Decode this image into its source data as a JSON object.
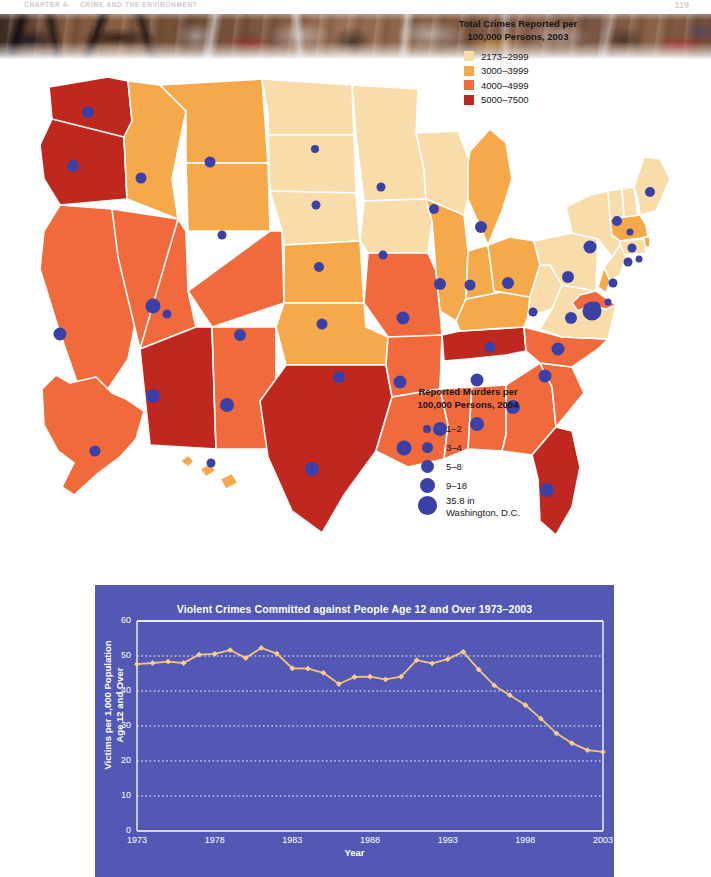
{
  "running_head": {
    "chapter": "CHAPTER 4",
    "separator": "•",
    "title": "CRIME AND THE ENVIRONMENT",
    "page_number": "119"
  },
  "photo": {
    "caption": "graffiti-covered-wall-photograph",
    "visible_tag_text": "R"
  },
  "crime_legend": {
    "title_line1": "Total Crimes Reported per",
    "title_line2": "100,000 Persons, 2003",
    "items": [
      {
        "label": "2173–2999",
        "color": "#f8dcaa"
      },
      {
        "label": "3000–3999",
        "color": "#f6a94a"
      },
      {
        "label": "4000–4999",
        "color": "#f06a3c"
      },
      {
        "label": "5000–7500",
        "color": "#c0281f"
      }
    ]
  },
  "murder_legend": {
    "title_line1": "Reported Murders per",
    "title_line2": "100,000 Persons, 2004",
    "dot_color": "#3b40a6",
    "items": [
      {
        "label": "1–2",
        "size": 8
      },
      {
        "label": "3–4",
        "size": 11
      },
      {
        "label": "5–8",
        "size": 13
      },
      {
        "label": "9–18",
        "size": 15
      },
      {
        "label": "35.8 in",
        "label2": "Washington, D.C.",
        "size": 19
      }
    ]
  },
  "map": {
    "name": "united-states-choropleth",
    "background": "#ffffff",
    "border_color": "#ffffff",
    "states": [
      {
        "code": "WA",
        "crime_color": "#c0281f",
        "dot": 12,
        "dx": 88,
        "dy": 53
      },
      {
        "code": "OR",
        "crime_color": "#c0281f",
        "dot": 12,
        "dx": 73,
        "dy": 107
      },
      {
        "code": "CA",
        "crime_color": "#f06a3c",
        "dot": 13,
        "dx": 60,
        "dy": 275
      },
      {
        "code": "NV",
        "crime_color": "#f06a3c",
        "dot": 15,
        "dx": 153,
        "dy": 247
      },
      {
        "code": "ID",
        "crime_color": "#f6a94a",
        "dot": 11,
        "dx": 141,
        "dy": 119
      },
      {
        "code": "MT",
        "crime_color": "#f6a94a",
        "dot": 11,
        "dx": 210,
        "dy": 103
      },
      {
        "code": "WY",
        "crime_color": "#f6a94a",
        "dot": 9,
        "dx": 222,
        "dy": 176
      },
      {
        "code": "UT",
        "crime_color": "#f06a3c",
        "dot": 9,
        "dx": 167,
        "dy": 255
      },
      {
        "code": "AZ",
        "crime_color": "#c0281f",
        "dot": 14,
        "dx": 153,
        "dy": 337
      },
      {
        "code": "NM",
        "crime_color": "#f06a3c",
        "dot": 14,
        "dx": 227,
        "dy": 346
      },
      {
        "code": "CO",
        "crime_color": "#f06a3c",
        "dot": 12,
        "dx": 240,
        "dy": 276
      },
      {
        "code": "ND",
        "crime_color": "#f8dcaa",
        "dot": 8,
        "dx": 315,
        "dy": 90
      },
      {
        "code": "SD",
        "crime_color": "#f8dcaa",
        "dot": 9,
        "dx": 316,
        "dy": 146
      },
      {
        "code": "NE",
        "crime_color": "#f8dcaa",
        "dot": 10,
        "dx": 319,
        "dy": 208
      },
      {
        "code": "KS",
        "crime_color": "#f6a94a",
        "dot": 11,
        "dx": 322,
        "dy": 265
      },
      {
        "code": "OK",
        "crime_color": "#f6a94a",
        "dot": 12,
        "dx": 339,
        "dy": 318
      },
      {
        "code": "TX",
        "crime_color": "#c0281f",
        "dot": 14,
        "dx": 312,
        "dy": 410
      },
      {
        "code": "MN",
        "crime_color": "#f8dcaa",
        "dot": 9,
        "dx": 381,
        "dy": 128
      },
      {
        "code": "IA",
        "crime_color": "#f8dcaa",
        "dot": 9,
        "dx": 383,
        "dy": 196
      },
      {
        "code": "MO",
        "crime_color": "#f06a3c",
        "dot": 13,
        "dx": 403,
        "dy": 259
      },
      {
        "code": "AR",
        "crime_color": "#f06a3c",
        "dot": 13,
        "dx": 400,
        "dy": 323
      },
      {
        "code": "LA",
        "crime_color": "#f06a3c",
        "dot": 15,
        "dx": 404,
        "dy": 389
      },
      {
        "code": "WI",
        "crime_color": "#f8dcaa",
        "dot": 10,
        "dx": 434,
        "dy": 150
      },
      {
        "code": "IL",
        "crime_color": "#f6a94a",
        "dot": 12,
        "dx": 440,
        "dy": 225
      },
      {
        "code": "MS",
        "crime_color": "#f06a3c",
        "dot": 14,
        "dx": 440,
        "dy": 370
      },
      {
        "code": "AL",
        "crime_color": "#f06a3c",
        "dot": 14,
        "dx": 477,
        "dy": 365
      },
      {
        "code": "TN",
        "crime_color": "#c0281f",
        "dot": 13,
        "dx": 477,
        "dy": 321
      },
      {
        "code": "KY",
        "crime_color": "#f6a94a",
        "dot": 11,
        "dx": 490,
        "dy": 288
      },
      {
        "code": "IN",
        "crime_color": "#f6a94a",
        "dot": 11,
        "dx": 470,
        "dy": 226
      },
      {
        "code": "MI",
        "crime_color": "#f6a94a",
        "dot": 12,
        "dx": 481,
        "dy": 168
      },
      {
        "code": "OH",
        "crime_color": "#f6a94a",
        "dot": 12,
        "dx": 508,
        "dy": 224
      },
      {
        "code": "WV",
        "crime_color": "#f8dcaa",
        "dot": 9,
        "dx": 533,
        "dy": 253
      },
      {
        "code": "GA",
        "crime_color": "#f06a3c",
        "dot": 14,
        "dx": 513,
        "dy": 348
      },
      {
        "code": "FL",
        "crime_color": "#c0281f",
        "dot": 14,
        "dx": 547,
        "dy": 431
      },
      {
        "code": "SC",
        "crime_color": "#f06a3c",
        "dot": 13,
        "dx": 545,
        "dy": 317
      },
      {
        "code": "NC",
        "crime_color": "#f06a3c",
        "dot": 13,
        "dx": 558,
        "dy": 290
      },
      {
        "code": "VA",
        "crime_color": "#f8dcaa",
        "dot": 12,
        "dx": 571,
        "dy": 259
      },
      {
        "code": "PA",
        "crime_color": "#f8dcaa",
        "dot": 12,
        "dx": 568,
        "dy": 218
      },
      {
        "code": "NY",
        "crime_color": "#f8dcaa",
        "dot": 13,
        "dx": 590,
        "dy": 188
      },
      {
        "code": "VT",
        "crime_color": "#f8dcaa",
        "dot": 10,
        "dx": 617,
        "dy": 162
      },
      {
        "code": "NH",
        "crime_color": "#f8dcaa",
        "dot": 7,
        "dx": 630,
        "dy": 173
      },
      {
        "code": "ME",
        "crime_color": "#f8dcaa",
        "dot": 10,
        "dx": 650,
        "dy": 133
      },
      {
        "code": "MA",
        "crime_color": "#f6a94a",
        "dot": 9,
        "dx": 632,
        "dy": 189
      },
      {
        "code": "RI",
        "crime_color": "#f6a94a",
        "dot": 7,
        "dx": 639,
        "dy": 200
      },
      {
        "code": "CT",
        "crime_color": "#f8dcaa",
        "dot": 9,
        "dx": 628,
        "dy": 203
      },
      {
        "code": "NJ",
        "crime_color": "#f8dcaa",
        "dot": 9,
        "dx": 613,
        "dy": 224
      },
      {
        "code": "DE",
        "crime_color": "#f6a94a",
        "dot": 7,
        "dx": 608,
        "dy": 243
      },
      {
        "code": "MD",
        "crime_color": "#f06a3c",
        "dot": 11,
        "dx": 595,
        "dy": 248
      },
      {
        "code": "DC",
        "crime_color": "#c0281f",
        "dot": 19,
        "dx": 592,
        "dy": 252
      },
      {
        "code": "AK",
        "crime_color": "#f06a3c",
        "dot": 11,
        "dx": 95,
        "dy": 392
      },
      {
        "code": "HI",
        "crime_color": "#f6a94a",
        "dot": 9,
        "dx": 211,
        "dy": 404
      }
    ]
  },
  "chart_data": {
    "type": "line",
    "title": "Violent Crimes Committed against People Age 12 and Over 1973–2003",
    "xlabel": "Year",
    "ylabel": "Victims per 1,000 Population Age 12 and Over",
    "ylabel_line1": "Victims per 1,000 Population",
    "ylabel_line2": "Age 12 and Over",
    "xlim": [
      1973,
      2003
    ],
    "ylim": [
      0,
      60
    ],
    "ytick_labels": [
      "60",
      "50",
      "40",
      "30",
      "20",
      "10",
      "0"
    ],
    "yticks": [
      60,
      50,
      40,
      30,
      20,
      10,
      0
    ],
    "xtick_labels": [
      "1973",
      "1978",
      "1983",
      "1988",
      "1993",
      "1998",
      "2003"
    ],
    "xticks": [
      1973,
      1978,
      1983,
      1988,
      1993,
      1998,
      2003
    ],
    "grid": "horizontal-dotted",
    "legend": "none",
    "background_color": "#5358b4",
    "line_color": "#f3c47a",
    "marker_color": "#f6cf8e",
    "axis_color": "#ffffff",
    "x": [
      1973,
      1974,
      1975,
      1976,
      1977,
      1978,
      1979,
      1980,
      1981,
      1982,
      1983,
      1984,
      1985,
      1986,
      1987,
      1988,
      1989,
      1990,
      1991,
      1992,
      1993,
      1994,
      1995,
      1996,
      1997,
      1998,
      1999,
      2000,
      2001,
      2002,
      2003
    ],
    "values": [
      47.7,
      48.0,
      48.4,
      48.0,
      50.4,
      50.6,
      51.7,
      49.4,
      52.3,
      50.7,
      46.5,
      46.4,
      45.2,
      42.0,
      44.0,
      44.1,
      43.3,
      44.1,
      48.8,
      47.9,
      49.1,
      51.2,
      46.1,
      41.6,
      38.8,
      36.0,
      32.1,
      27.9,
      25.1,
      23.1,
      22.6
    ]
  }
}
